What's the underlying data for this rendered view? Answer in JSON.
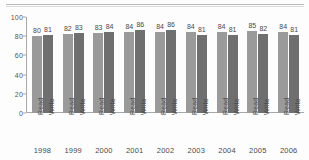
{
  "chart_data": {
    "type": "bar",
    "title": "",
    "subtitle": "",
    "xlabel": "",
    "ylabel": "",
    "ylim": [
      0,
      100
    ],
    "yticks": [
      0,
      20,
      40,
      60,
      80,
      100
    ],
    "grid": false,
    "legend_position": "none",
    "categories": [
      "1998",
      "1999",
      "2000",
      "2001",
      "2002",
      "2003",
      "2004",
      "2005",
      "2006"
    ],
    "series": [
      {
        "name": "Read",
        "color": "#9a9a9a",
        "values": [
          80,
          82,
          83,
          84,
          84,
          84,
          84,
          85,
          84
        ]
      },
      {
        "name": "Write",
        "color": "#6f6f6f",
        "values": [
          81,
          83,
          84,
          86,
          86,
          81,
          81,
          82,
          81
        ]
      }
    ],
    "data_labels": [
      [
        "80",
        "81"
      ],
      [
        "82",
        "83"
      ],
      [
        "83",
        "84"
      ],
      [
        "84",
        "86"
      ],
      [
        "84",
        "86"
      ],
      [
        "84",
        "81"
      ],
      [
        "84",
        "81"
      ],
      [
        "85",
        "82"
      ],
      [
        "84",
        "81"
      ]
    ]
  }
}
